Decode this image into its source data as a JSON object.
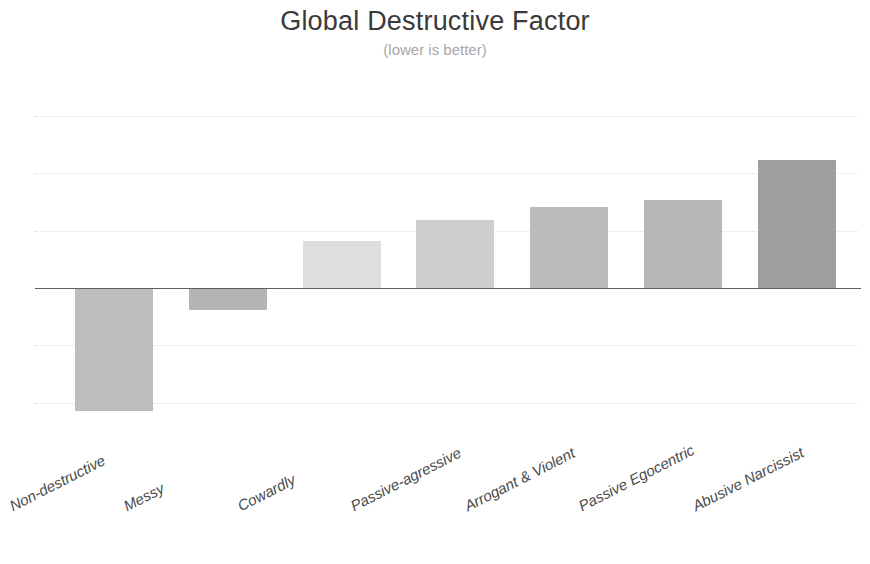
{
  "chart_data": {
    "type": "bar",
    "title": "Global Destructive Factor",
    "subtitle": "(lower is better)",
    "xlabel": "",
    "ylabel": "",
    "categories": [
      "Non-destructive",
      "Messy",
      "Cowardly",
      "Passive-agressive",
      "Arrogant & Violent",
      "Passive Egocentric",
      "Abusive Narcissist"
    ],
    "values": [
      -2.15,
      -0.38,
      0.82,
      1.19,
      1.42,
      1.54,
      2.23
    ],
    "ylim": [
      -2.5,
      3.0
    ],
    "gridlines": [
      3.0,
      2.0,
      1.0,
      0.0,
      -1.0,
      -2.0
    ],
    "grid": true,
    "legend": "none",
    "axis_tick_labels_shown": false,
    "bar_colors": [
      "#bdbdbd",
      "#b4b4b4",
      "#dedede",
      "#cfcfcf",
      "#bcbcbc",
      "#b6b6b6",
      "#9f9f9f"
    ],
    "zero_axis_color": "#5f5f5f",
    "gridline_color": "#d6d6d6",
    "background_color": "#ffffff",
    "title_color": "#3a3a3a",
    "subtitle_color": "#a8a8a8",
    "label_color": "#4a4a4a"
  }
}
